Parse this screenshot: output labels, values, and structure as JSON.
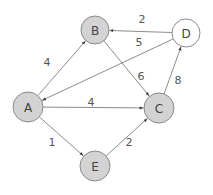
{
  "graph": {
    "colors": {
      "node_fill": "#d3d3d3",
      "node_fill_alt": "#ffffff",
      "node_stroke": "#8a8a8a",
      "edge": "#6e6e6e",
      "text": "#444444"
    },
    "nodes": [
      {
        "id": "A",
        "label": "A",
        "cx": 28,
        "cy": 107,
        "r": 15,
        "filled": true
      },
      {
        "id": "B",
        "label": "B",
        "cx": 95,
        "cy": 30,
        "r": 14,
        "filled": true
      },
      {
        "id": "C",
        "label": "C",
        "cx": 159,
        "cy": 108,
        "r": 15,
        "filled": true
      },
      {
        "id": "D",
        "label": "D",
        "cx": 186,
        "cy": 33,
        "r": 14,
        "filled": false
      },
      {
        "id": "E",
        "label": "E",
        "cx": 95,
        "cy": 166,
        "r": 15,
        "filled": true
      }
    ],
    "edges": [
      {
        "from": "A",
        "to": "B",
        "weight": "4",
        "lx": 47,
        "ly": 62
      },
      {
        "from": "A",
        "to": "C",
        "weight": "4",
        "lx": 91,
        "ly": 102
      },
      {
        "from": "A",
        "to": "E",
        "weight": "1",
        "lx": 52,
        "ly": 142
      },
      {
        "from": "E",
        "to": "C",
        "weight": "2",
        "lx": 129,
        "ly": 142
      },
      {
        "from": "B",
        "to": "C",
        "weight": "6",
        "lx": 141,
        "ly": 76
      },
      {
        "from": "C",
        "to": "D",
        "weight": "8",
        "lx": 178,
        "ly": 80
      },
      {
        "from": "D",
        "to": "B",
        "weight": "2",
        "lx": 142,
        "ly": 19
      },
      {
        "from": "D",
        "to": "A",
        "weight": "5",
        "lx": 139,
        "ly": 42
      }
    ]
  }
}
